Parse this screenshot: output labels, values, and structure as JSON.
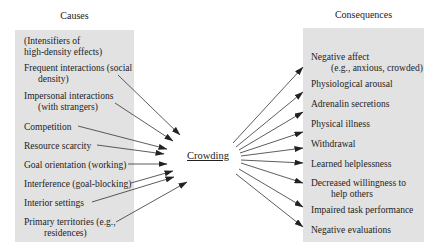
{
  "diagram": {
    "causes_heading": "Causes",
    "consequences_heading": "Consequences",
    "center_label": "Crowding",
    "causes": [
      {
        "line1": "(Intensifiers of",
        "line2": "high-density effects)"
      },
      {
        "line1": "Frequent interactions (social",
        "line2": "density)"
      },
      {
        "line1": "Impersonal interactions",
        "line2": "(with strangers)"
      },
      {
        "line1": "Competition"
      },
      {
        "line1": "Resource scarcity"
      },
      {
        "line1": "Goal orientation (working)"
      },
      {
        "line1": "Interference (goal-blocking)"
      },
      {
        "line1": "Interior settings"
      },
      {
        "line1": "Primary territories (e.g.,",
        "line2": "residences)"
      }
    ],
    "consequences": [
      {
        "line1": "Negative affect",
        "line2": "(e.g., anxious, crowded)"
      },
      {
        "line1": "Physiological arousal"
      },
      {
        "line1": "Adrenalin secretions"
      },
      {
        "line1": "Physical illness"
      },
      {
        "line1": "Withdrawal"
      },
      {
        "line1": "Learned helplessness"
      },
      {
        "line1": "Decreased willingness to",
        "line2": "help others"
      },
      {
        "line1": "Impaired task performance"
      },
      {
        "line1": "Negative evaluations"
      }
    ],
    "colors": {
      "box_fill": "#e2e2e2",
      "line": "#333333",
      "text": "#222222"
    }
  }
}
